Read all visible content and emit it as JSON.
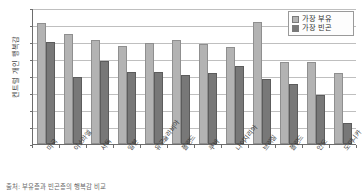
{
  "chart_data": {
    "type": "bar",
    "title": "",
    "xlabel": "",
    "ylabel": "켄트럴 개인 행복감",
    "ylim": [
      0,
      8
    ],
    "yticks": [
      0,
      1,
      2,
      3,
      4,
      5,
      6,
      7,
      8
    ],
    "grid": true,
    "legend_position": "top-right",
    "categories": [
      "미국",
      "이스라엘",
      "서독",
      "일본",
      "유고슬라비아",
      "폴란드",
      "쿠바",
      "나이지리아",
      "브라질",
      "폴란드",
      "인도",
      "도미니카"
    ],
    "series": [
      {
        "name": "가장 부유",
        "color": "#b3b3b3",
        "values": [
          7.1,
          6.45,
          6.1,
          5.75,
          5.95,
          6.1,
          5.9,
          5.7,
          7.15,
          4.8,
          4.8,
          4.15
        ]
      },
      {
        "name": "가장 빈곤",
        "color": "#787878",
        "values": [
          6.0,
          3.95,
          4.9,
          4.25,
          4.25,
          4.05,
          4.2,
          4.6,
          3.8,
          3.55,
          2.9,
          1.25
        ]
      }
    ]
  },
  "caption": {
    "text": "출처: 부유층과 빈곤층의 행복감 비교"
  }
}
